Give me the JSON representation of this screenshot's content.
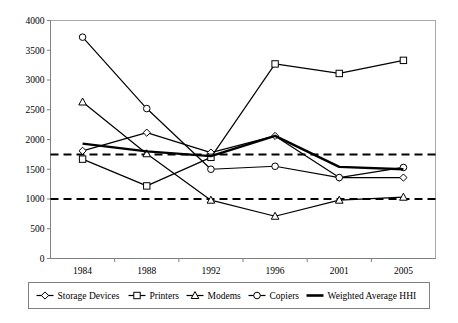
{
  "chart_data": {
    "type": "line",
    "title": "",
    "xlabel": "",
    "ylabel": "",
    "categories": [
      "1984",
      "1988",
      "1992",
      "1996",
      "2001",
      "2005"
    ],
    "ylim": [
      0,
      4000
    ],
    "ytick_step": 500,
    "yticks": [
      "0",
      "500",
      "1000",
      "1500",
      "2000",
      "2500",
      "3000",
      "3500",
      "4000"
    ],
    "grid": false,
    "legend_position": "bottom",
    "series": [
      {
        "name": "Storage Devices",
        "marker": "diamond",
        "values": [
          1810,
          2115,
          1780,
          2060,
          1360,
          1360
        ]
      },
      {
        "name": "Printers",
        "marker": "square",
        "values": [
          1670,
          1220,
          1700,
          3270,
          3110,
          3330
        ]
      },
      {
        "name": "Modems",
        "marker": "triangle",
        "values": [
          2630,
          1760,
          980,
          710,
          980,
          1030
        ]
      },
      {
        "name": "Copiers",
        "marker": "circle",
        "values": [
          3720,
          2520,
          1500,
          1550,
          1360,
          1530
        ]
      },
      {
        "name": "Weighted Average HHI",
        "marker": "none",
        "values": [
          1930,
          1800,
          1720,
          2060,
          1540,
          1500
        ]
      }
    ],
    "reference_lines": [
      {
        "name": "upper-threshold",
        "value": 1750,
        "style": "dashed"
      },
      {
        "name": "lower-threshold",
        "value": 1000,
        "style": "dashed"
      }
    ]
  },
  "legend": {
    "items": [
      {
        "label": "Storage Devices",
        "marker": "diamond"
      },
      {
        "label": "Printers",
        "marker": "square"
      },
      {
        "label": "Modems",
        "marker": "triangle"
      },
      {
        "label": "Copiers",
        "marker": "circle"
      },
      {
        "label": "Weighted Average HHI",
        "marker": "none"
      }
    ]
  }
}
